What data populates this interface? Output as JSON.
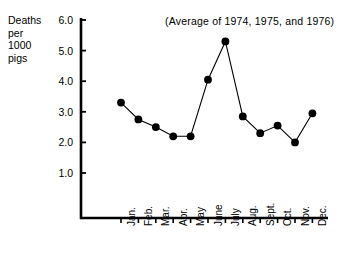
{
  "chart_data": {
    "type": "line",
    "title": "",
    "annotation": "(Average of 1974, 1975, and 1976)",
    "ylabel": "Deaths\nper\n1000\npigs",
    "xlabel": "",
    "categories": [
      "Jan.",
      "Feb.",
      "Mar.",
      "Apr.",
      "May",
      "June",
      "July",
      "Aug.",
      "Sept.",
      "Oct.",
      "Nov.",
      "Dec."
    ],
    "values": [
      3.3,
      2.75,
      2.5,
      2.2,
      2.2,
      4.05,
      5.3,
      2.85,
      2.3,
      2.55,
      2.0,
      2.95
    ],
    "ylim": [
      0,
      6.0
    ],
    "ytick_values": [
      1.0,
      2.0,
      3.0,
      4.0,
      5.0,
      6.0
    ],
    "ytick_labels": [
      "1.0",
      "2.0",
      "3.0",
      "4.0",
      "5.0",
      "6.0"
    ],
    "grid": false,
    "legend": false,
    "marker": "filled-circle",
    "line_color": "#000000",
    "marker_color": "#000000",
    "axis_color": "#000000"
  }
}
